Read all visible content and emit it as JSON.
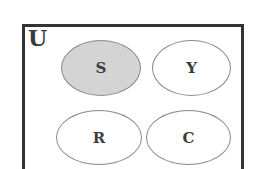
{
  "diagram": {
    "type": "venn",
    "universe_label": "U",
    "sets": [
      {
        "label": "S",
        "shaded": true,
        "fill": "#d4d4d4"
      },
      {
        "label": "Y",
        "shaded": false,
        "fill": "#ffffff"
      },
      {
        "label": "R",
        "shaded": false,
        "fill": "#ffffff"
      },
      {
        "label": "C",
        "shaded": false,
        "fill": "#ffffff"
      }
    ],
    "relationships": "All four sets are disjoint within universe U; set S is shaded."
  }
}
